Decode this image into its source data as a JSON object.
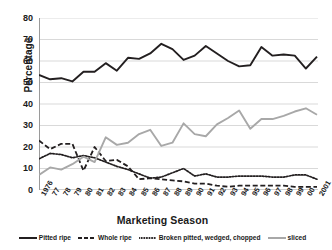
{
  "chart_data": {
    "type": "line",
    "title": "",
    "xlabel": "Marketing Season",
    "ylabel": "Percentage",
    "ylim": [
      0,
      80
    ],
    "ytick_step": 10,
    "yticks": [
      80,
      70,
      60,
      50,
      40,
      30,
      20,
      10,
      0
    ],
    "grid": "horizontal",
    "legend_position": "bottom",
    "categories": [
      "1976",
      "77",
      "78",
      "79",
      "80",
      "81",
      "82",
      "83",
      "84",
      "85",
      "86",
      "87",
      "88",
      "89",
      "90",
      "91",
      "92",
      "93",
      "94",
      "95",
      "96",
      "97",
      "98",
      "99",
      "00",
      "2001"
    ],
    "series": [
      {
        "name": "Pitted ripe",
        "style": "solid",
        "color": "#231f20",
        "values": [
          53.5,
          51.5,
          52.0,
          50.5,
          55.0,
          55.0,
          59.0,
          55.5,
          61.5,
          61.0,
          63.5,
          68.0,
          65.5,
          60.5,
          62.5,
          67.0,
          63.5,
          60.0,
          57.5,
          58.0,
          66.5,
          62.5,
          63.0,
          62.5,
          56.5,
          62.0
        ]
      },
      {
        "name": "Whole ripe",
        "style": "dashed",
        "color": "#231f20",
        "values": [
          23.0,
          19.0,
          21.5,
          21.5,
          9.0,
          20.0,
          13.5,
          14.0,
          11.0,
          5.0,
          5.5,
          5.0,
          4.5,
          4.0,
          3.0,
          3.0,
          2.0,
          1.5,
          2.0,
          2.0,
          2.0,
          2.0,
          2.0,
          1.5,
          1.5,
          1.5
        ]
      },
      {
        "name": "Broken pitted, wedged, chopped",
        "style": "dotted",
        "color": "#231f20",
        "values": [
          14.5,
          17.0,
          16.5,
          15.0,
          16.0,
          15.0,
          13.0,
          11.0,
          9.5,
          7.5,
          5.5,
          6.0,
          8.0,
          10.0,
          6.5,
          7.5,
          6.0,
          6.0,
          6.5,
          6.5,
          6.5,
          6.0,
          6.0,
          7.0,
          7.0,
          5.0
        ]
      },
      {
        "name": "sliced",
        "style": "solid",
        "color": "#a8a8a8",
        "values": [
          7.0,
          10.5,
          9.5,
          12.0,
          15.5,
          13.0,
          24.5,
          21.0,
          22.0,
          26.0,
          28.0,
          20.5,
          22.0,
          31.0,
          26.0,
          25.0,
          30.5,
          33.5,
          37.0,
          28.5,
          33.0,
          33.0,
          34.5,
          36.5,
          38.0,
          35.0
        ]
      }
    ]
  },
  "axes": {
    "y_title": "Percentage",
    "x_title": "Marketing Season"
  },
  "colors": {
    "dark": "#231f20",
    "gray": "#a8a8a8",
    "gridline": "#d9d9d9",
    "axis": "#9a9a9a",
    "background": "#ffffff"
  }
}
